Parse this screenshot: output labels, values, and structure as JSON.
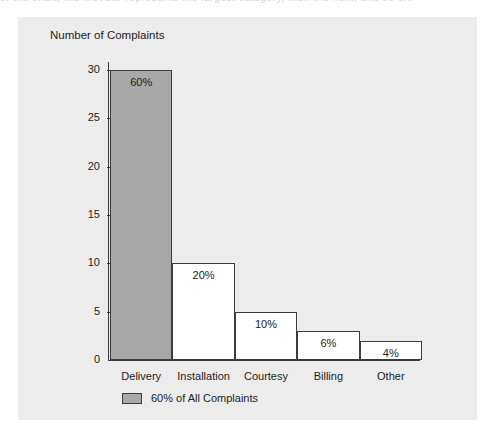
{
  "page": {
    "bleed_text": "of the chart, the first bar represents the largest category, then the next, and so on.",
    "background": "#ffffff",
    "panel_color": "#ececec"
  },
  "chart_data": {
    "type": "bar",
    "title": "Number of Complaints",
    "xlabel": "",
    "ylabel": "",
    "categories": [
      "Delivery",
      "Installation",
      "Courtesy",
      "Billing",
      "Other"
    ],
    "values": [
      30,
      10,
      5,
      3,
      2
    ],
    "data_labels": [
      "60%",
      "20%",
      "10%",
      "6%",
      "4%"
    ],
    "percentages": [
      60,
      20,
      10,
      6,
      4
    ],
    "ylim": [
      0,
      30
    ],
    "yticks": [
      0,
      5,
      10,
      15,
      20,
      25,
      30
    ],
    "ytick_labels": [
      "0",
      "5",
      "10",
      "15",
      "20",
      "25",
      "30"
    ],
    "grid": false,
    "legend_position": "bottom",
    "legend": [
      {
        "label": "60% of All Complaints",
        "color": "#a8a8a8"
      }
    ],
    "highlight_index": 0,
    "bar_fill_default": "#ffffff",
    "bar_edge_color": "#3c3c3c",
    "axis_color": "#3a3a3a"
  }
}
